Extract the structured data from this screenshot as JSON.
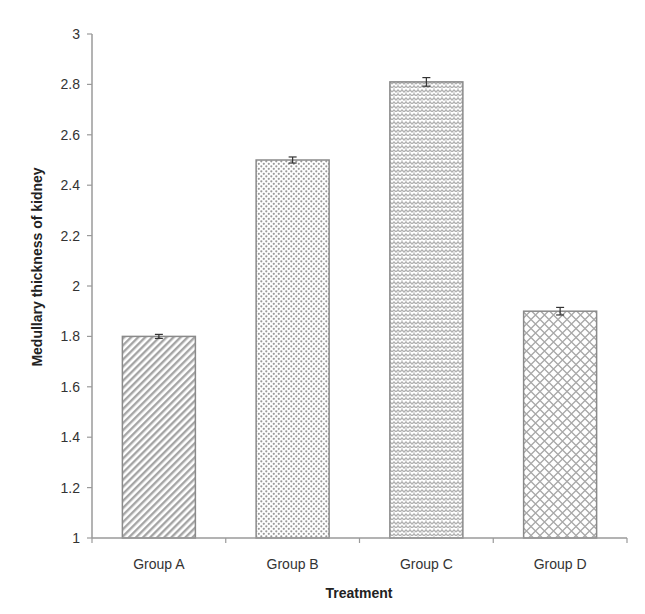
{
  "chart_data": {
    "type": "bar",
    "title": "",
    "xlabel": "Treatment",
    "ylabel": "Medullary thickness of kidney",
    "categories": [
      "Group A",
      "Group B",
      "Group C",
      "Group D"
    ],
    "values": [
      1.8,
      2.5,
      2.81,
      1.9
    ],
    "error": [
      0.008,
      0.012,
      0.017,
      0.015
    ],
    "ylim": [
      1,
      3
    ],
    "yticks": [
      1,
      1.2,
      1.4,
      1.6,
      1.8,
      2,
      2.2,
      2.4,
      2.6,
      2.8,
      3
    ],
    "ytick_labels": [
      "1",
      "1.2",
      "1.4",
      "1.6",
      "1.8",
      "2",
      "2.2",
      "2.4",
      "2.6",
      "2.8",
      "3"
    ],
    "grid": false,
    "legend": null,
    "bar_patterns": [
      "diagonal-stripes",
      "dots",
      "weave",
      "diamond-lattice"
    ]
  },
  "colors": {
    "axis": "#9a9a9a",
    "bar_border": "#8a8a8a",
    "pattern": "#a0a0a0",
    "error_bar": "#333333"
  }
}
